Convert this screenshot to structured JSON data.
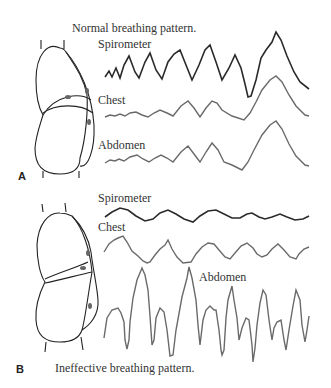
{
  "panel_a": {
    "letter": "A",
    "caption": "Normal breathing pattern.",
    "traces": {
      "spirometer": "Spirometer",
      "chest": "Chest",
      "abdomen": "Abdomen"
    }
  },
  "panel_b": {
    "letter": "B",
    "caption": "Ineffective breathing pattern.",
    "traces": {
      "spirometer": "Spirometer",
      "chest": "Chest",
      "abdomen": "Abdomen"
    }
  },
  "colors": {
    "spirometer_trace": "#2a2a2a",
    "chest_abdomen_trace": "#6a6a6a",
    "outline": "#222222",
    "sensor": "#666666"
  }
}
